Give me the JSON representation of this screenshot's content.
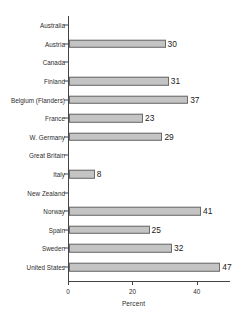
{
  "chart_data": {
    "type": "bar",
    "orientation": "horizontal",
    "title": "",
    "xlabel": "Percent",
    "ylabel": "",
    "xlim": [
      0,
      50
    ],
    "xticks": [
      0,
      20,
      40
    ],
    "xticklabels": [
      "0",
      "20",
      "40"
    ],
    "grid": false,
    "legend": null,
    "categories": [
      "Australia",
      "Austria",
      "Canada",
      "Finland",
      "Belgium (Flanders)",
      "France",
      "W. Germany",
      "Great Britain",
      "Italy",
      "New Zealand",
      "Norway",
      "Spain",
      "Sweden",
      "United States"
    ],
    "values": [
      null,
      30,
      null,
      31,
      37,
      23,
      29,
      null,
      8,
      null,
      41,
      25,
      32,
      47
    ],
    "value_labels": [
      "",
      "30",
      "",
      "31",
      "37",
      "23",
      "29",
      "",
      "8",
      "",
      "41",
      "25",
      "32",
      "47"
    ],
    "bar_color": "#c4c4c4",
    "bar_edge_color": "#6b6b6b",
    "axis_color": "#444444"
  }
}
